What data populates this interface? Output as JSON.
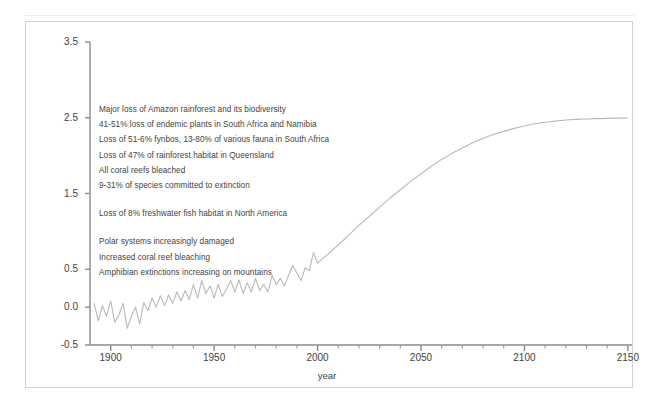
{
  "chart_data": {
    "type": "line",
    "title": "",
    "xlabel": "year",
    "ylabel": "°C temperature rise above the pre-industrial level",
    "xlim": [
      1890,
      2152
    ],
    "ylim": [
      -0.5,
      3.5
    ],
    "xticks": [
      "1900",
      "1950",
      "2000",
      "2050",
      "2100",
      "2150"
    ],
    "xtick_values": [
      1900,
      1950,
      2000,
      2050,
      2100,
      2150
    ],
    "minor_xtick_interval": 10,
    "yticks": [
      "3.5",
      "2.5",
      "1.5",
      "0.5",
      "0.0",
      "-0.5"
    ],
    "ytick_values": [
      3.5,
      2.5,
      1.5,
      0.5,
      0.0,
      -0.5
    ],
    "grid": false,
    "legend": "none",
    "line_color": "#b9b9b9",
    "series": [
      {
        "name": "Observed and projected global mean temperature rise",
        "x": [
          1892,
          1894,
          1896,
          1898,
          1900,
          1902,
          1904,
          1906,
          1908,
          1910,
          1912,
          1914,
          1916,
          1918,
          1920,
          1922,
          1924,
          1926,
          1928,
          1930,
          1932,
          1934,
          1936,
          1938,
          1940,
          1942,
          1944,
          1946,
          1948,
          1950,
          1952,
          1954,
          1956,
          1958,
          1960,
          1962,
          1964,
          1966,
          1968,
          1970,
          1972,
          1974,
          1976,
          1978,
          1980,
          1982,
          1984,
          1986,
          1988,
          1990,
          1992,
          1994,
          1996,
          1998,
          2000,
          2005,
          2010,
          2015,
          2020,
          2025,
          2030,
          2035,
          2040,
          2045,
          2050,
          2055,
          2060,
          2065,
          2070,
          2075,
          2080,
          2085,
          2090,
          2095,
          2100,
          2105,
          2110,
          2115,
          2120,
          2125,
          2130,
          2135,
          2140,
          2145,
          2150
        ],
        "y": [
          0.05,
          -0.18,
          0.02,
          -0.12,
          0.08,
          -0.2,
          -0.1,
          0.05,
          -0.28,
          -0.12,
          0.0,
          -0.22,
          0.06,
          -0.05,
          0.12,
          0.0,
          0.15,
          0.02,
          0.16,
          0.05,
          0.2,
          0.08,
          0.22,
          0.1,
          0.3,
          0.12,
          0.35,
          0.18,
          0.28,
          0.12,
          0.3,
          0.14,
          0.24,
          0.35,
          0.2,
          0.36,
          0.18,
          0.32,
          0.2,
          0.38,
          0.22,
          0.3,
          0.2,
          0.42,
          0.3,
          0.38,
          0.28,
          0.42,
          0.55,
          0.45,
          0.35,
          0.52,
          0.48,
          0.72,
          0.58,
          0.7,
          0.82,
          0.95,
          1.08,
          1.2,
          1.32,
          1.44,
          1.55,
          1.66,
          1.76,
          1.86,
          1.95,
          2.03,
          2.1,
          2.17,
          2.23,
          2.28,
          2.32,
          2.36,
          2.39,
          2.42,
          2.44,
          2.455,
          2.47,
          2.478,
          2.484,
          2.489,
          2.492,
          2.495,
          2.497
        ]
      }
    ],
    "annotations": [
      {
        "text": "Major loss of Amazon rainforest and its biodiversity",
        "y_value": 2.52
      },
      {
        "text": "41-51% loss of endemic plants in South Africa and Namibia",
        "y_value": 2.36
      },
      {
        "text": "Loss of 51-6% fynbos, 13-80% of various fauna in South Africa",
        "y_value": 2.2
      },
      {
        "text": "Loss of 47% of rainforest habitat in Queensland",
        "y_value": 2.04
      },
      {
        "text": "All coral reefs bleached",
        "y_value": 1.88
      },
      {
        "text": "9-31% of species committed to extinction",
        "y_value": 1.72
      },
      {
        "text": "Loss of 8% freshwater fish habitat in North America",
        "y_value": 1.42,
        "gap_before": true
      },
      {
        "text": "Polar systems increasingly damaged",
        "y_value": 1.12,
        "gap_before": true
      },
      {
        "text": "Increased coral reef bleaching",
        "y_value": 0.96
      },
      {
        "text": "Amphibian extinctions increasing on mountains",
        "y_value": 0.8
      }
    ]
  }
}
